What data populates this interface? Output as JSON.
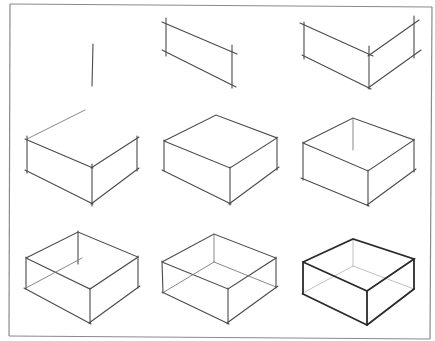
{
  "figure": {
    "layout": {
      "rows": 3,
      "columns": 3
    },
    "colors": {
      "background": "#ffffff",
      "frame": "#8a8a8a",
      "pencil_light": "#7a7a7a",
      "pencil_dark": "#2a2a2a"
    },
    "steps": [
      {
        "step": 1,
        "content": "single vertical line (front corner)"
      },
      {
        "step": 2,
        "content": "left face parallelogram"
      },
      {
        "step": 3,
        "content": "left and right faces"
      },
      {
        "step": 4,
        "content": "box front with top edge extending to back"
      },
      {
        "step": 5,
        "content": "closed top face"
      },
      {
        "step": 6,
        "content": "back vertical edge added"
      },
      {
        "step": 7,
        "content": "hidden back-bottom edges started"
      },
      {
        "step": 8,
        "content": "full wireframe box"
      },
      {
        "step": 9,
        "content": "final box with darkened visible edges"
      }
    ]
  }
}
